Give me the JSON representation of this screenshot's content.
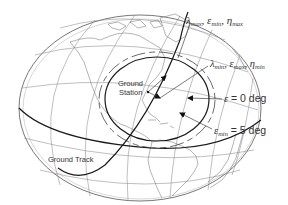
{
  "diagram": {
    "labels": {
      "lambda_max_line": {
        "sym1": "λ",
        "sub1": "max",
        "sep1": ", ",
        "sym2": "ε",
        "sub2": "min",
        "sep2": ", ",
        "sym3": "η",
        "sub3": "max"
      },
      "lambda_min_line": {
        "sym1": "λ",
        "sub1": "min",
        "sep1": ", ",
        "sym2": "ε",
        "sub2": "max",
        "sep2": ", ",
        "sym3": "η",
        "sub3": "min"
      },
      "eps_zero": {
        "sym": "ε",
        "text": " = 0 deg"
      },
      "eps_min": {
        "sym": "ε",
        "sub": "min",
        "text": " = 5 deg"
      },
      "ground_station_line1": "Ground",
      "ground_station_line2": "Station",
      "ground_track": "Ground Track"
    },
    "colors": {
      "ink": "#1a1a1a",
      "grid": "#8a8a8a",
      "background": "#ffffff"
    }
  }
}
